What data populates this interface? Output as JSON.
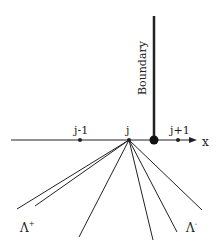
{
  "diagram": {
    "axis_label": "x",
    "boundary_label": "Boundary",
    "points": [
      {
        "label": "j-1"
      },
      {
        "label": "j"
      },
      {
        "label": "j+1"
      }
    ],
    "lambda_plus": {
      "base": "Λ",
      "sup": "+"
    },
    "lambda_minus": {
      "base": "Λ",
      "sup": "-"
    },
    "colors": {
      "line": "#222222",
      "background": "#ffffff"
    }
  }
}
